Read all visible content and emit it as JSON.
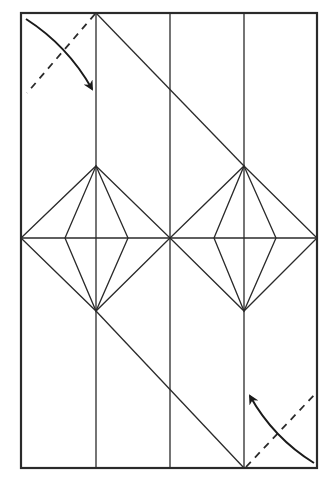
{
  "diagram": {
    "type": "origami-crease-pattern",
    "paper": {
      "x": 21,
      "y": 13,
      "width": 296,
      "height": 455,
      "color": "#ffffff",
      "line_color": "#2a2a2a"
    },
    "vertical_creases_x": [
      96,
      170,
      244
    ],
    "horizontal_crease_y": 238,
    "diagonals": [
      {
        "from": [
          96,
          13
        ],
        "to": [
          244,
          166
        ]
      },
      {
        "from": [
          96,
          311
        ],
        "to": [
          244,
          468
        ]
      }
    ],
    "diamonds": [
      {
        "name": "left-diamond",
        "top": [
          96,
          166
        ],
        "bottom": [
          96,
          311
        ],
        "left": [
          21,
          238
        ],
        "right": [
          170,
          238
        ],
        "inner_left": [
          65,
          238
        ],
        "inner_right": [
          128,
          238
        ]
      },
      {
        "name": "right-diamond",
        "top": [
          244,
          166
        ],
        "bottom": [
          244,
          311
        ],
        "left": [
          170,
          238
        ],
        "right": [
          317,
          238
        ],
        "inner_left": [
          214,
          238
        ],
        "inner_right": [
          276,
          238
        ]
      }
    ],
    "folds": [
      {
        "name": "top-left-corner-fold",
        "valley_line": {
          "from": [
            95,
            14
          ],
          "to": [
            27,
            93
          ]
        },
        "arrow_from": [
          26,
          19
        ],
        "arrow_to": [
          92,
          89
        ],
        "direction": "down-right"
      },
      {
        "name": "bottom-right-corner-fold",
        "valley_line": {
          "from": [
            246,
            467
          ],
          "to": [
            316,
            393
          ]
        },
        "arrow_from": [
          314,
          463
        ],
        "arrow_to": [
          250,
          396
        ],
        "direction": "up-left"
      }
    ]
  }
}
